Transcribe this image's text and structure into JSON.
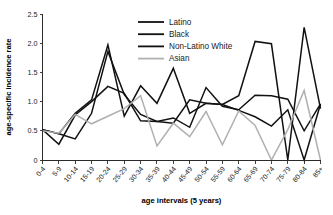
{
  "chart_data": {
    "type": "line",
    "title": "",
    "xlabel": "age intervals (5 years)",
    "ylabel": "age-specific incidence rate",
    "ylim": [
      0,
      2.5
    ],
    "yticks": [
      "0",
      "0.5",
      "1.0",
      "1.5",
      "2.0",
      "2.5"
    ],
    "ytick_values": [
      0,
      0.5,
      1.0,
      1.5,
      2.0,
      2.5
    ],
    "grid": false,
    "legend_position": "top-center",
    "categories": [
      "0-4",
      "5-9",
      "10-14",
      "15-19",
      "20-24",
      "25-29",
      "30-34",
      "35-39",
      "40-44",
      "45-49",
      "50-54",
      "55-59",
      "60-64",
      "65-69",
      "70-74",
      "75-79",
      "80-84",
      "85+"
    ],
    "series": [
      {
        "name": "Latino",
        "color": "#111111",
        "width": 1.5,
        "values": [
          0.52,
          0.45,
          0.8,
          1.03,
          1.97,
          0.75,
          1.27,
          0.97,
          1.57,
          0.8,
          0.97,
          0.95,
          0.85,
          0.74,
          0.58,
          0.86,
          0.0,
          0.96
        ]
      },
      {
        "name": "Black",
        "color": "#111111",
        "width": 1.5,
        "values": [
          0.52,
          0.45,
          0.36,
          0.8,
          1.86,
          1.12,
          0.78,
          0.66,
          0.63,
          1.03,
          0.97,
          0.95,
          1.1,
          2.03,
          1.99,
          0.0,
          2.27,
          0.88
        ]
      },
      {
        "name": "Non-Latino White",
        "color": "#111111",
        "width": 1.5,
        "values": [
          0.52,
          0.27,
          0.77,
          1.0,
          1.26,
          1.14,
          0.67,
          0.66,
          0.72,
          0.56,
          1.24,
          0.92,
          0.86,
          1.11,
          1.1,
          1.04,
          0.5,
          0.96
        ]
      },
      {
        "name": "Asian",
        "color": "#b0b0b0",
        "width": 1.5,
        "values": [
          0.5,
          0.46,
          0.78,
          0.62,
          0.75,
          0.88,
          1.1,
          0.24,
          0.63,
          0.4,
          0.83,
          0.26,
          0.84,
          0.59,
          0.0,
          0.52,
          1.19,
          0.0
        ]
      }
    ]
  },
  "legend": {
    "items": [
      {
        "label": "Latino"
      },
      {
        "label": "Black"
      },
      {
        "label": "Non-Latino White"
      },
      {
        "label": "Asian"
      }
    ]
  }
}
